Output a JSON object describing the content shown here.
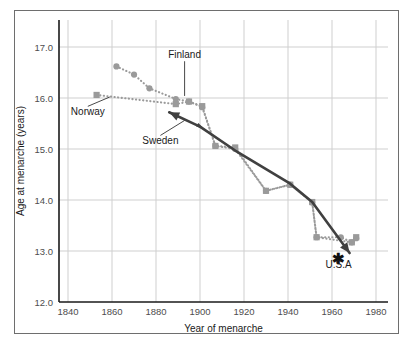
{
  "chart_data": {
    "type": "line",
    "title": "",
    "xlabel": "Year of menarche",
    "ylabel": "Age at menarche (years)",
    "xlim": [
      1835,
      1985
    ],
    "ylim": [
      12.0,
      17.35
    ],
    "xticks": [
      "1840",
      "1860",
      "1880",
      "1900",
      "1920",
      "1940",
      "1960",
      "1980"
    ],
    "xtick_values": [
      1840,
      1860,
      1880,
      1900,
      1920,
      1940,
      1960,
      1980
    ],
    "yticks": [
      "17.0",
      "16.0",
      "15.0",
      "14.0",
      "13.0",
      "12.0"
    ],
    "ytick_values": [
      17.0,
      16.0,
      15.0,
      14.0,
      13.0,
      12.0
    ],
    "grid": "both",
    "legend": "inline-annotations",
    "series": [
      {
        "name": "Finland",
        "marker": "circle",
        "linestyle": "dotted",
        "color": "#9a9a9a",
        "x": [
          1862,
          1870,
          1877,
          1889,
          1895,
          1901,
          1907,
          1916,
          1930,
          1941,
          1951,
          1953,
          1964,
          1969,
          1971
        ],
        "y": [
          16.62,
          16.46,
          16.19,
          15.98,
          15.93,
          15.82,
          15.06,
          15.0,
          14.18,
          14.3,
          13.95,
          13.27,
          13.27,
          13.17,
          13.25
        ]
      },
      {
        "name": "Norway",
        "marker": "square",
        "linestyle": "dotted",
        "color": "#9a9a9a",
        "x": [
          1853,
          1889,
          1895,
          1901,
          1907,
          1916,
          1930,
          1941,
          1951,
          1953,
          1969,
          1971
        ],
        "y": [
          16.06,
          15.88,
          15.93,
          15.84,
          15.06,
          15.03,
          14.18,
          14.3,
          13.96,
          13.27,
          13.17,
          13.27
        ]
      },
      {
        "name": "Sweden",
        "marker": "none",
        "linestyle": "solid",
        "color": "#404040",
        "x": [
          1886,
          1900,
          1916,
          1941,
          1951,
          1968
        ],
        "y": [
          15.72,
          15.44,
          14.97,
          14.32,
          13.96,
          12.96
        ]
      },
      {
        "name": "U.S.A",
        "marker": "asterisk",
        "linestyle": "none",
        "color": "#111111",
        "x": [
          1963
        ],
        "y": [
          12.83
        ]
      }
    ],
    "annotations": [
      {
        "text": "Finland",
        "x": 1893,
        "y": 16.78,
        "leader_to_x": 1893,
        "leader_to_y": 16.04
      },
      {
        "text": "Norway",
        "x": 1849,
        "y": 15.66,
        "leader_to_x": 1859,
        "leader_to_y": 16.02
      },
      {
        "text": "Sweden",
        "x": 1882,
        "y": 15.09,
        "leader_to_x": 1893,
        "leader_to_y": 15.56
      },
      {
        "text": "U.S.A",
        "x": 1963,
        "y": 12.66,
        "leader_to_x": null,
        "leader_to_y": null
      }
    ]
  },
  "axis": {
    "x_title": "Year of menarche",
    "y_title": "Age at menarche (years)",
    "x_tick_labels": [
      "1840",
      "1860",
      "1880",
      "1900",
      "1920",
      "1940",
      "1960",
      "1980"
    ],
    "y_tick_labels": [
      "17.0",
      "16.0",
      "15.0",
      "14.0",
      "13.0",
      "12.0"
    ]
  },
  "labels": {
    "finland": "Finland",
    "norway": "Norway",
    "sweden": "Sweden",
    "usa": "U.S.A"
  },
  "colors": {
    "grid": "#cfcfcf",
    "axis_line": "#1a1a1a",
    "frame": "#6e6e6e",
    "dotted_series": "#9a9a9a",
    "solid_series": "#404040",
    "background": "#ffffff",
    "tick_text": "#4d4d4d",
    "title_text": "#1a1a1a"
  }
}
